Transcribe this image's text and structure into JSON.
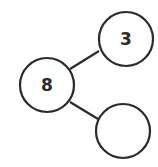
{
  "diagram": {
    "type": "number-bond",
    "whole": {
      "value": "8",
      "cx": 47,
      "cy": 85,
      "r": 27
    },
    "parts": [
      {
        "value": "3",
        "cx": 126,
        "cy": 39,
        "r": 27
      },
      {
        "value": "",
        "cx": 123,
        "cy": 131,
        "r": 27
      }
    ],
    "connectors": [
      {
        "x1": 70,
        "y1": 69,
        "x2": 99,
        "y2": 51
      },
      {
        "x1": 70,
        "y1": 102,
        "x2": 98,
        "y2": 119
      }
    ],
    "stroke_color": "#2b2b2b",
    "fill_color": "#ffffff"
  }
}
